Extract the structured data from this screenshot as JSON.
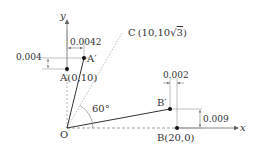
{
  "diagram": {
    "axes": {
      "x_label": "x",
      "y_label": "y",
      "origin_label": "O"
    },
    "points": {
      "A": {
        "label": "A",
        "coords": "(0,10)"
      },
      "A_prime": {
        "label": "A′"
      },
      "B": {
        "label": "B",
        "coords": "(20,0)"
      },
      "B_prime": {
        "label": "B′"
      },
      "C": {
        "label": "C",
        "coords": "(10,10√3)"
      }
    },
    "dimensions": {
      "A_horizontal": "0.0042",
      "A_vertical": "0.004",
      "B_horizontal": "0.002",
      "B_vertical": "0.009"
    },
    "angle": {
      "label": "60°"
    },
    "colors": {
      "line": "#333333",
      "dim_line": "#888888",
      "dotted_line": "#999999",
      "c_line": "#aaaaaa"
    }
  }
}
